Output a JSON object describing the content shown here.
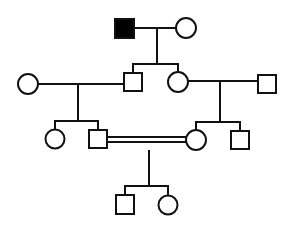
{
  "diagram": {
    "type": "pedigree",
    "colors": {
      "stroke": "#111111",
      "affected_fill": "#000000",
      "unaffected_fill": "#ffffff",
      "background": "#ffffff"
    },
    "generations": [
      {
        "id": "I",
        "individuals": [
          {
            "id": "I-1",
            "sex": "male",
            "affected": true
          },
          {
            "id": "I-2",
            "sex": "female",
            "affected": false
          }
        ]
      },
      {
        "id": "II",
        "individuals": [
          {
            "id": "II-1",
            "sex": "female",
            "affected": false,
            "note": "married-in"
          },
          {
            "id": "II-2",
            "sex": "male",
            "affected": false,
            "parents": [
              "I-1",
              "I-2"
            ]
          },
          {
            "id": "II-3",
            "sex": "female",
            "affected": false,
            "parents": [
              "I-1",
              "I-2"
            ]
          },
          {
            "id": "II-4",
            "sex": "male",
            "affected": false,
            "note": "married-in"
          }
        ]
      },
      {
        "id": "III",
        "individuals": [
          {
            "id": "III-1",
            "sex": "female",
            "affected": false,
            "parents": [
              "II-1",
              "II-2"
            ]
          },
          {
            "id": "III-2",
            "sex": "male",
            "affected": false,
            "parents": [
              "II-1",
              "II-2"
            ]
          },
          {
            "id": "III-3",
            "sex": "female",
            "affected": false,
            "parents": [
              "II-3",
              "II-4"
            ]
          },
          {
            "id": "III-4",
            "sex": "male",
            "affected": false,
            "parents": [
              "II-3",
              "II-4"
            ]
          }
        ]
      },
      {
        "id": "IV",
        "individuals": [
          {
            "id": "IV-1",
            "sex": "male",
            "affected": false,
            "parents": [
              "III-2",
              "III-3"
            ]
          },
          {
            "id": "IV-2",
            "sex": "female",
            "affected": false,
            "parents": [
              "III-2",
              "III-3"
            ]
          }
        ]
      }
    ],
    "matings": [
      {
        "partners": [
          "I-1",
          "I-2"
        ],
        "consanguineous": false
      },
      {
        "partners": [
          "II-1",
          "II-2"
        ],
        "consanguineous": false
      },
      {
        "partners": [
          "II-3",
          "II-4"
        ],
        "consanguineous": false
      },
      {
        "partners": [
          "III-2",
          "III-3"
        ],
        "consanguineous": true
      }
    ]
  }
}
